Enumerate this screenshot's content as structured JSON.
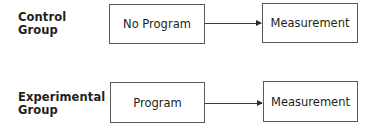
{
  "diagram": {
    "rows": [
      {
        "group_label_line1": "Control",
        "group_label_line2": "Group",
        "condition_box": "No Program",
        "outcome_box": "Measurement"
      },
      {
        "group_label_line1": "Experimental",
        "group_label_line2": "Group",
        "condition_box": "Program",
        "outcome_box": "Measurement"
      }
    ],
    "arrow_color": "#2a2a2a",
    "box_border_color": "#5a5a5a"
  }
}
